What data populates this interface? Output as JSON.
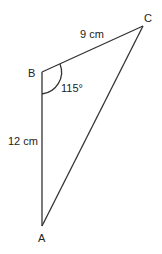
{
  "diagram": {
    "type": "triangle",
    "vertices": {
      "A": {
        "label": "A"
      },
      "B": {
        "label": "B"
      },
      "C": {
        "label": "C"
      }
    },
    "sides": {
      "BC": {
        "label": "9 cm"
      },
      "AB": {
        "label": "12 cm"
      }
    },
    "angles": {
      "B": {
        "label": "115°"
      }
    },
    "colors": {
      "stroke": "#333333",
      "text": "#222222"
    }
  }
}
